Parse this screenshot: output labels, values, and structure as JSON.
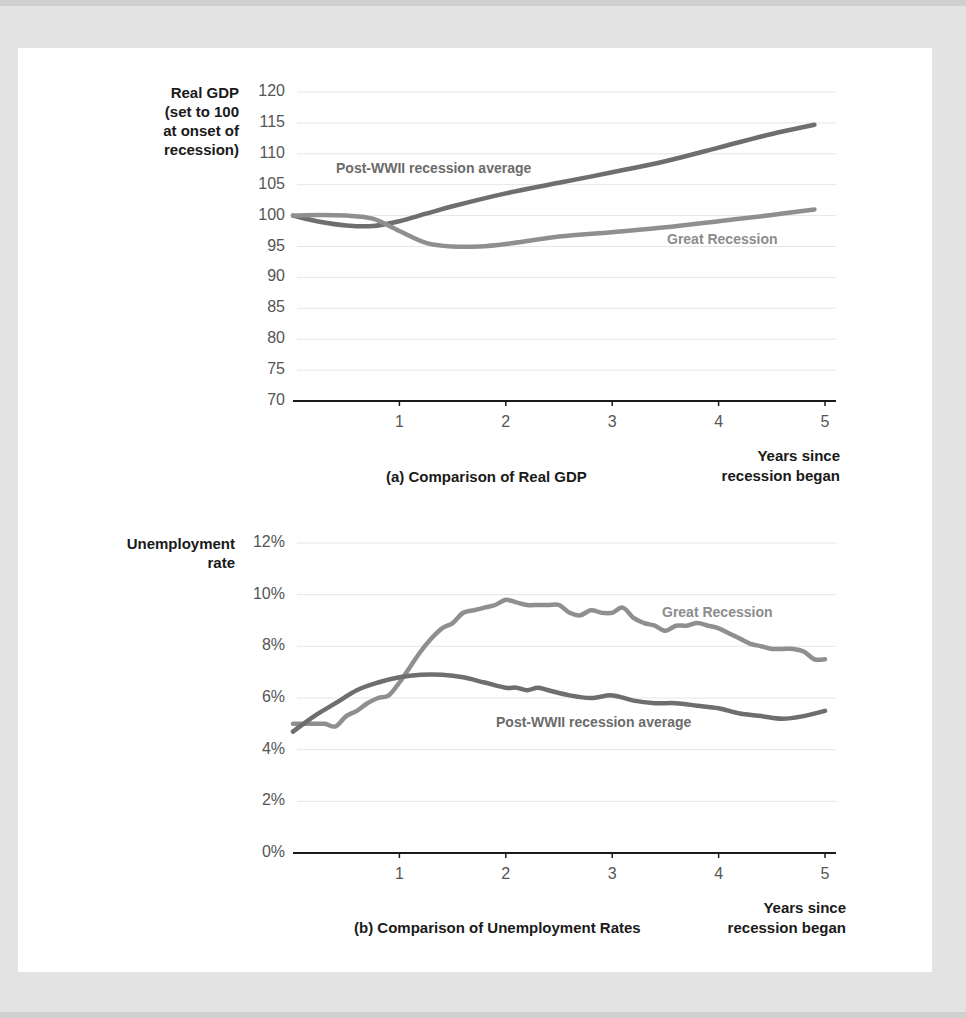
{
  "chart_data": [
    {
      "type": "line",
      "title": "(a) Comparison of Real GDP",
      "ylabel": "Real GDP (set to 100 at onset of recession)",
      "ylabel_lines": [
        "Real GDP",
        "(set to 100",
        "at onset of",
        "recession)"
      ],
      "xlabel": "Years since recession began",
      "xlabel_lines": [
        "Years since",
        "recession began"
      ],
      "ylim": [
        70,
        120
      ],
      "xlim": [
        0,
        5
      ],
      "yticks": [
        "120",
        "115",
        "110",
        "105",
        "100",
        "95",
        "90",
        "85",
        "80",
        "75",
        "70"
      ],
      "xticks": [
        "1",
        "2",
        "3",
        "4",
        "5"
      ],
      "grid": true,
      "series": [
        {
          "name": "Post-WWII recession average",
          "color": "#6e6e6e",
          "x": [
            0,
            0.25,
            0.5,
            0.75,
            1.0,
            1.25,
            1.5,
            2.0,
            2.5,
            3.0,
            3.5,
            4.0,
            4.5,
            4.9
          ],
          "values": [
            100,
            99,
            98.4,
            98.3,
            99.1,
            100.3,
            101.5,
            103.6,
            105.3,
            107.0,
            108.8,
            111.0,
            113.2,
            114.7
          ]
        },
        {
          "name": "Great Recession",
          "color": "#8f8f8f",
          "x": [
            0,
            0.25,
            0.5,
            0.75,
            1.0,
            1.25,
            1.5,
            1.75,
            2.0,
            2.5,
            3.0,
            3.5,
            4.0,
            4.5,
            4.9
          ],
          "values": [
            100,
            100.1,
            100,
            99.5,
            97.5,
            95.6,
            95.0,
            95.0,
            95.4,
            96.6,
            97.3,
            98.1,
            99.1,
            100.1,
            101.0
          ]
        }
      ]
    },
    {
      "type": "line",
      "title": "(b) Comparison of Unemployment Rates",
      "ylabel": "Unemployment rate",
      "ylabel_lines": [
        "Unemployment",
        "rate"
      ],
      "xlabel": "Years since recession began",
      "xlabel_lines": [
        "Years since",
        "recession began"
      ],
      "ylim": [
        0,
        12
      ],
      "xlim": [
        0,
        5
      ],
      "yticks": [
        "12%",
        "10%",
        "8%",
        "6%",
        "4%",
        "2%",
        "0%"
      ],
      "xticks": [
        "1",
        "2",
        "3",
        "4",
        "5"
      ],
      "grid": true,
      "series": [
        {
          "name": "Great Recession",
          "color": "#8f8f8f",
          "x": [
            0,
            0.1,
            0.2,
            0.3,
            0.4,
            0.5,
            0.6,
            0.7,
            0.8,
            0.9,
            1.0,
            1.1,
            1.2,
            1.3,
            1.4,
            1.5,
            1.6,
            1.7,
            1.8,
            1.9,
            2.0,
            2.1,
            2.2,
            2.3,
            2.4,
            2.5,
            2.6,
            2.7,
            2.8,
            2.9,
            3.0,
            3.1,
            3.2,
            3.3,
            3.4,
            3.5,
            3.6,
            3.7,
            3.8,
            3.9,
            4.0,
            4.1,
            4.2,
            4.3,
            4.4,
            4.5,
            4.6,
            4.7,
            4.8,
            4.9,
            5.0
          ],
          "values": [
            5.0,
            5.0,
            5.0,
            5.0,
            4.9,
            5.3,
            5.5,
            5.8,
            6.0,
            6.1,
            6.6,
            7.2,
            7.8,
            8.3,
            8.7,
            8.9,
            9.3,
            9.4,
            9.5,
            9.6,
            9.8,
            9.7,
            9.6,
            9.6,
            9.6,
            9.6,
            9.3,
            9.2,
            9.4,
            9.3,
            9.3,
            9.5,
            9.1,
            8.9,
            8.8,
            8.6,
            8.8,
            8.8,
            8.9,
            8.8,
            8.7,
            8.5,
            8.3,
            8.1,
            8.0,
            7.9,
            7.9,
            7.9,
            7.8,
            7.5,
            7.5
          ]
        },
        {
          "name": "Post-WWII recession average",
          "color": "#6e6e6e",
          "x": [
            0,
            0.2,
            0.4,
            0.6,
            0.8,
            1.0,
            1.2,
            1.4,
            1.6,
            1.8,
            2.0,
            2.1,
            2.2,
            2.3,
            2.4,
            2.6,
            2.8,
            3.0,
            3.2,
            3.4,
            3.6,
            3.8,
            4.0,
            4.2,
            4.4,
            4.6,
            4.8,
            5.0
          ],
          "values": [
            4.7,
            5.3,
            5.8,
            6.3,
            6.6,
            6.8,
            6.9,
            6.9,
            6.8,
            6.6,
            6.4,
            6.4,
            6.3,
            6.4,
            6.3,
            6.1,
            6.0,
            6.1,
            5.9,
            5.8,
            5.8,
            5.7,
            5.6,
            5.4,
            5.3,
            5.2,
            5.3,
            5.5
          ]
        }
      ]
    }
  ],
  "labels": {
    "a_postwwii": "Post-WWII recession average",
    "a_great": "Great Recession",
    "b_great": "Great Recession",
    "b_postwwii": "Post-WWII recession average"
  }
}
